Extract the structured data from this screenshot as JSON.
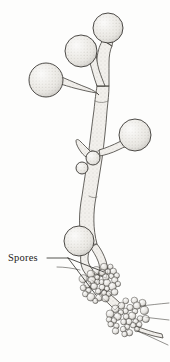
{
  "figure": {
    "domain_type": "scientific-line-illustration",
    "background_color": "#fdfdfc",
    "ink_color": "#3a3834",
    "fill_color": "#e9e7e2",
    "shade_color": "#bdbab4",
    "width": 170,
    "height": 362
  },
  "labels": [
    {
      "id": "spores",
      "text": "Spores",
      "x": 8,
      "y": 261,
      "leader": {
        "elbow_x": 68,
        "elbow_y": 258,
        "targets": [
          {
            "x": 104,
            "y": 272
          },
          {
            "x": 96,
            "y": 295
          }
        ]
      }
    }
  ],
  "vesicles": [
    {
      "id": "vesicle-top-right",
      "cx": 108,
      "cy": 28,
      "r": 15
    },
    {
      "id": "vesicle-upper-mid",
      "cx": 81,
      "cy": 51,
      "r": 16
    },
    {
      "id": "vesicle-left",
      "cx": 46,
      "cy": 80,
      "r": 17
    },
    {
      "id": "vesicle-right-mid",
      "cx": 135,
      "cy": 135,
      "r": 16
    },
    {
      "id": "vesicle-lower-left",
      "cx": 79,
      "cy": 241,
      "r": 15
    },
    {
      "id": "vesicle-small-upper",
      "cx": 93,
      "cy": 158,
      "r": 7
    },
    {
      "id": "vesicle-small-lower",
      "cx": 82,
      "cy": 168,
      "r": 6
    }
  ],
  "spore_clusters": [
    {
      "id": "spore-cluster-upper",
      "cx": 100,
      "cy": 283,
      "count": 34,
      "spread_x": 20,
      "spread_y": 17,
      "radius_min": 2.6,
      "radius_max": 4.2
    },
    {
      "id": "spore-cluster-lower",
      "cx": 128,
      "cy": 316,
      "count": 34,
      "spread_x": 20,
      "spread_y": 17,
      "radius_min": 2.6,
      "radius_max": 4.2
    }
  ],
  "hyphae": [
    {
      "id": "main-stem",
      "description": "central vertical stippled tube"
    },
    {
      "id": "branch-top-right",
      "description": "stalk to top-right vesicle"
    },
    {
      "id": "branch-upper-mid",
      "description": "stalk to upper-middle vesicle"
    },
    {
      "id": "branch-left",
      "description": "stalk to left vesicle"
    },
    {
      "id": "branch-right-mid",
      "description": "stalk to right mid vesicle"
    },
    {
      "id": "branch-finger",
      "description": "small pointed projection at mid junction"
    },
    {
      "id": "lower-fork",
      "description": "forked base leading to spore clusters"
    },
    {
      "id": "trailing-hypha",
      "description": "thin hyphae exiting right edge"
    }
  ]
}
